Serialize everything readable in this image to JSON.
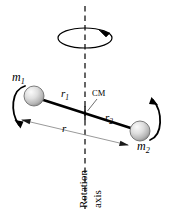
{
  "figure": {
    "background_color": "#ffffff",
    "stroke_color": "#000000",
    "sphere_fill_light": "#f2f2f2",
    "sphere_fill_mid": "#c9c9c9",
    "sphere_fill_dark": "#8e8e8e",
    "dimension_line_color": "#8a8a8a"
  },
  "labels": {
    "mass1": "m",
    "mass1_sub": "1",
    "mass2": "m",
    "mass2_sub": "2",
    "radius1": "r",
    "radius1_sub": "1",
    "radius2": "r",
    "radius2_sub": "2",
    "radius_total": "r",
    "center_of_mass": "CM",
    "axis_line1": "Rotation",
    "axis_line2": "axis"
  },
  "geometry": {
    "axis_x": 85,
    "axis_y_top": 6,
    "axis_y_bottom": 209,
    "rod_x1": 34,
    "rod_y1": 97,
    "rod_x2": 140,
    "rod_y2": 131,
    "cm_x": 85,
    "cm_y": 113,
    "mass1_center_x": 34,
    "mass1_center_y": 96,
    "mass1_radius": 10,
    "mass2_center_x": 140,
    "mass2_center_y": 131,
    "mass2_radius": 10,
    "spin_ellipse_cx": 85,
    "spin_ellipse_cy": 38,
    "spin_ellipse_rx": 27,
    "spin_ellipse_ry": 10,
    "dimension_arrow_x1": 22,
    "dimension_arrow_y1": 120,
    "dimension_arrow_x2": 128,
    "dimension_arrow_y2": 145
  }
}
